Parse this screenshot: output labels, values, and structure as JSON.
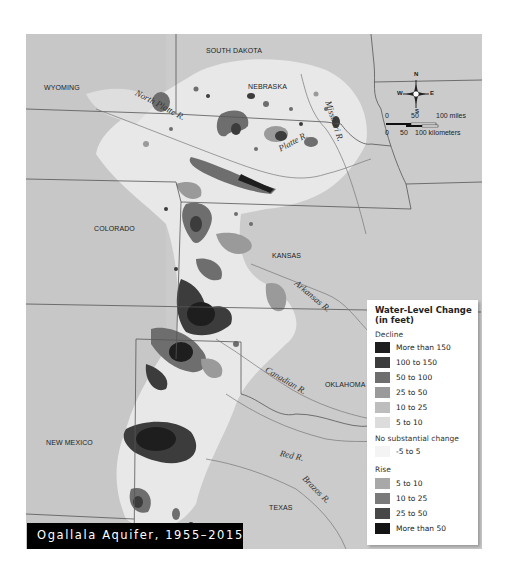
{
  "title": "Ogallala Aquifer, 1955–2015",
  "states": {
    "south_dakota": "SOUTH DAKOTA",
    "wyoming": "WYOMING",
    "nebraska": "NEBRASKA",
    "colorado": "COLORADO",
    "kansas": "KANSAS",
    "oklahoma": "OKLAHOMA",
    "new_mexico": "NEW MEXICO",
    "texas": "TEXAS"
  },
  "rivers": {
    "north_platte": "North Platte R.",
    "platte": "Platte R.",
    "missouri": "Missouri R.",
    "arkansas": "Arkansas R.",
    "canadian": "Canadian R.",
    "red": "Red R.",
    "brazos": "Brazos R."
  },
  "compass": {
    "n": "N",
    "s": "S",
    "e": "E",
    "w": "W"
  },
  "scale": {
    "miles_0": "0",
    "miles_50": "50",
    "miles_100": "100 miles",
    "km_0": "0",
    "km_50": "50",
    "km_100": "100 kilometers"
  },
  "legend": {
    "title": "Water-Level Change (in feet)",
    "decline_label": "Decline",
    "decline": [
      {
        "label": "More than 150",
        "color": "#1e1e1e"
      },
      {
        "label": "100 to 150",
        "color": "#3c3c3c"
      },
      {
        "label": "50 to 100",
        "color": "#6e6e6e"
      },
      {
        "label": "25 to 50",
        "color": "#9a9a9a"
      },
      {
        "label": "10 to 25",
        "color": "#bdbdbd"
      },
      {
        "label": "5 to 10",
        "color": "#dcdcdc"
      }
    ],
    "nochange_label": "No substantial change",
    "nochange": [
      {
        "label": "-5 to 5",
        "color": "#f4f4f4"
      }
    ],
    "rise_label": "Rise",
    "rise": [
      {
        "label": "5 to 10",
        "color": "#a8a8a8"
      },
      {
        "label": "10 to 25",
        "color": "#7a7a7a"
      },
      {
        "label": "25 to 50",
        "color": "#474747"
      },
      {
        "label": "More than 50",
        "color": "#141414"
      }
    ]
  }
}
